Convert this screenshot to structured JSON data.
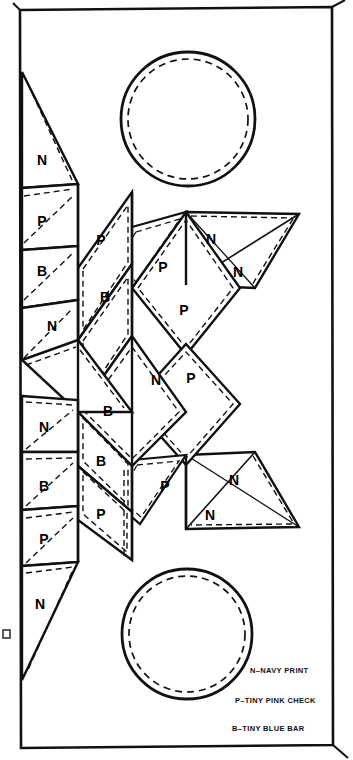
{
  "page": {
    "background": "#ffffff",
    "ink": "#000000",
    "width": 353,
    "height": 760
  },
  "frame": {
    "name": "page-border",
    "top_left": [
      20,
      10
    ],
    "top_right": [
      332,
      7
    ],
    "bottom_right": [
      333,
      745
    ],
    "bottom_left": [
      21,
      748
    ]
  },
  "legend": {
    "title": "",
    "items": [
      {
        "code": "N",
        "text": "N–NAVY PRINT",
        "fabric": "NAVY PRINT"
      },
      {
        "code": "P",
        "text": "P–TINY PINK CHECK",
        "fabric": "TINY PINK CHECK"
      },
      {
        "code": "B",
        "text": "B–TINY BLUE BAR",
        "fabric": "TINY BLUE BAR"
      }
    ]
  },
  "circles": [
    {
      "name": "top-circle",
      "cx": 188,
      "cy": 119,
      "r_outer": 67,
      "r_dashed": 60
    },
    {
      "name": "bottom-circle",
      "cx": 187,
      "cy": 634,
      "r_outer": 65,
      "r_dashed": 58
    }
  ],
  "strips": [
    {
      "name": "strip-1",
      "patches": [
        "N",
        "P",
        "B",
        "N",
        "N",
        "B",
        "P",
        "N"
      ]
    },
    {
      "name": "strip-2",
      "patches": [
        "P",
        "B",
        "B",
        "B",
        "P"
      ]
    },
    {
      "name": "strip-3",
      "patches": [
        "P",
        "P",
        "P",
        "P"
      ]
    },
    {
      "name": "strip-4",
      "patches": [
        "N",
        "N",
        "N",
        "N"
      ]
    }
  ],
  "patch_labels": [
    {
      "code": "N",
      "x": 42,
      "y": 161
    },
    {
      "code": "P",
      "x": 42,
      "y": 222
    },
    {
      "code": "B",
      "x": 42,
      "y": 265
    },
    {
      "code": "N",
      "x": 52,
      "y": 322
    },
    {
      "code": "N",
      "x": 44,
      "y": 424
    },
    {
      "code": "B",
      "x": 44,
      "y": 487
    },
    {
      "code": "P",
      "x": 44,
      "y": 537
    },
    {
      "code": "N",
      "x": 40,
      "y": 602
    },
    {
      "code": "P",
      "x": 101,
      "y": 239
    },
    {
      "code": "B",
      "x": 105,
      "y": 295
    },
    {
      "code": "B",
      "x": 106,
      "y": 409
    },
    {
      "code": "B",
      "x": 101,
      "y": 459
    },
    {
      "code": "P",
      "x": 101,
      "y": 512
    },
    {
      "code": "P",
      "x": 163,
      "y": 265
    },
    {
      "code": "P",
      "x": 183,
      "y": 308
    },
    {
      "code": "N",
      "x": 156,
      "y": 377
    },
    {
      "code": "P",
      "x": 190,
      "y": 377
    },
    {
      "code": "P",
      "x": 165,
      "y": 483
    },
    {
      "code": "N",
      "x": 211,
      "y": 237
    },
    {
      "code": "N",
      "x": 237,
      "y": 270
    },
    {
      "code": "N",
      "x": 233,
      "y": 478
    },
    {
      "code": "N",
      "x": 210,
      "y": 513
    }
  ],
  "notes": {
    "edge_mark": "page-edge-artifact"
  }
}
